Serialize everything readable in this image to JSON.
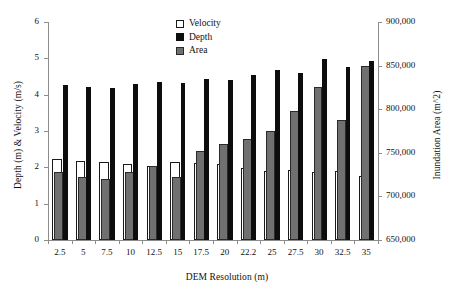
{
  "chart_data": {
    "type": "bar",
    "title": "",
    "xlabel": "DEM Resolution (m)",
    "ylabel": "Depth (m) & Velocity (m/s)",
    "y2label": "Inundation Area (m^2)",
    "categories": [
      "2.5",
      "5",
      "7.5",
      "10",
      "12.5",
      "15",
      "17.5",
      "20",
      "22.2",
      "25",
      "27.5",
      "30",
      "32.5",
      "35"
    ],
    "ylim": [
      0,
      6
    ],
    "yticks": [
      "0",
      "1",
      "2",
      "3",
      "4",
      "5",
      "6"
    ],
    "y2lim": [
      650000,
      900000
    ],
    "y2ticks": [
      "650,000",
      "700,000",
      "750,000",
      "800,000",
      "850,000",
      "900,000"
    ],
    "grid": false,
    "legend_position": "top-center",
    "series": [
      {
        "name": "Velocity",
        "axis": "left",
        "unit": "m/s",
        "color": "#ffffff",
        "edge_color": "#1a1a1a",
        "values": [
          2.22,
          2.18,
          2.14,
          2.08,
          2.04,
          2.14,
          2.12,
          2.1,
          1.98,
          1.89,
          1.92,
          1.88,
          1.9,
          1.75
        ]
      },
      {
        "name": "Depth",
        "axis": "left",
        "unit": "m",
        "color": "#0d0d0d",
        "edge_color": "#0d0d0d",
        "values": [
          4.26,
          4.2,
          4.19,
          4.29,
          4.35,
          4.33,
          4.44,
          4.41,
          4.55,
          4.67,
          4.61,
          4.99,
          4.75,
          4.94
        ]
      },
      {
        "name": "Area",
        "axis": "right",
        "unit": "m^2",
        "color": "#707070",
        "edge_color": "#2a2a2a",
        "values": [
          728000,
          722500,
          720000,
          728000,
          735000,
          722500,
          752000,
          760500,
          766000,
          775000,
          798000,
          825000,
          788000,
          849000
        ]
      }
    ]
  },
  "legend": {
    "items": [
      {
        "label": "Velocity"
      },
      {
        "label": "Depth"
      },
      {
        "label": "Area"
      }
    ]
  }
}
